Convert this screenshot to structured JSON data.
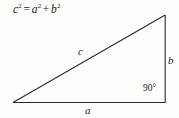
{
  "figure": {
    "type": "geometry-diagram",
    "background_color": "#fdfdfc",
    "stroke_color": "#2a2a2a"
  },
  "equation": {
    "base_c": "c",
    "exp_c": "2",
    "equals": "=",
    "base_a": "a",
    "exp_a": "2",
    "plus": "+",
    "base_b": "b",
    "exp_b": "2",
    "full_text": "c2 = a2 + b2"
  },
  "triangle": {
    "vertices": {
      "bottom_left": {
        "x": 13,
        "y": 102
      },
      "bottom_right": {
        "x": 165,
        "y": 102
      },
      "top_right": {
        "x": 165,
        "y": 15
      }
    },
    "labels": {
      "base": "a",
      "vertical": "b",
      "hypotenuse": "c",
      "right_angle": "90°"
    }
  }
}
